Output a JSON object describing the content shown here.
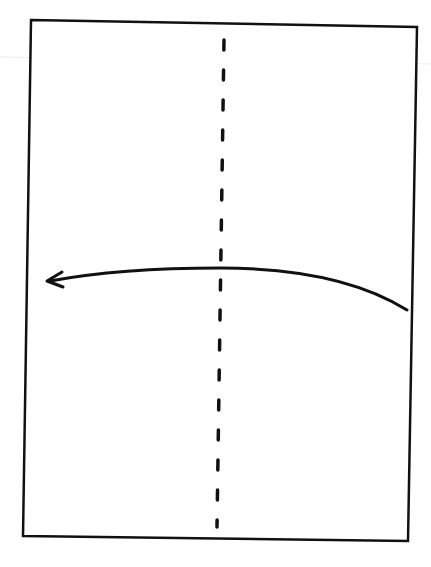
{
  "diagram": {
    "type": "origami-fold-instruction",
    "colors": {
      "stroke": "#111111",
      "background": "#ffffff",
      "scan_line": "#e6e6e6"
    },
    "paper": {
      "shape": "rectangle",
      "corners": [
        [
          31,
          20
        ],
        [
          417,
          27
        ],
        [
          408,
          541
        ],
        [
          23,
          536
        ]
      ]
    },
    "fold_line": {
      "style": "dashed",
      "kind": "valley-fold",
      "from": [
        224,
        40
      ],
      "to": [
        217,
        527
      ]
    },
    "arrow": {
      "direction": "right-to-left",
      "from": [
        407,
        310
      ],
      "via": [
        220,
        268
      ],
      "to": [
        47,
        281
      ]
    }
  }
}
